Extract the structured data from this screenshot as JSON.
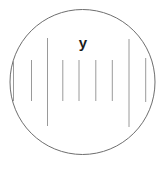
{
  "diagram": {
    "type": "microscope-eyepiece-scale",
    "label": "y",
    "colors": {
      "background": "#ffffff",
      "circle_stroke": "#6e6e6e",
      "tick_stroke": "#9a9a9a",
      "label_color": "#1c1c1c"
    },
    "circle": {
      "cx": 82.5,
      "cy": 82,
      "r": 72.5,
      "stroke_width": 1
    },
    "label_pos": {
      "x": 83,
      "y": 48
    },
    "ticks": [
      {
        "x": 13.5,
        "y1": 60,
        "y2": 101,
        "kind": "short"
      },
      {
        "x": 31.5,
        "y1": 60,
        "y2": 101,
        "kind": "short"
      },
      {
        "x": 47.5,
        "y1": 38,
        "y2": 126,
        "kind": "tall"
      },
      {
        "x": 62.8,
        "y1": 60,
        "y2": 101,
        "kind": "short"
      },
      {
        "x": 79.0,
        "y1": 60,
        "y2": 101,
        "kind": "short"
      },
      {
        "x": 95.8,
        "y1": 60,
        "y2": 101,
        "kind": "short"
      },
      {
        "x": 112.3,
        "y1": 60,
        "y2": 101,
        "kind": "short"
      },
      {
        "x": 129.0,
        "y1": 39,
        "y2": 127,
        "kind": "tall"
      },
      {
        "x": 145.7,
        "y1": 58,
        "y2": 102,
        "kind": "short"
      }
    ]
  }
}
